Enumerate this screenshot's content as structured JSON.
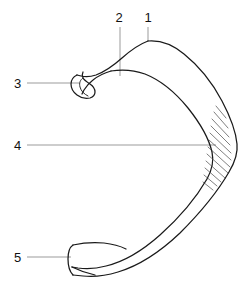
{
  "figure": {
    "background_color": "#ffffff",
    "outline_color": "#1a1a1a",
    "leader_color": "#8a8a8a",
    "label_color": "#111111",
    "width": 241,
    "height": 282
  },
  "labels": [
    {
      "id": "1",
      "text": "1",
      "x": 148,
      "y": 22,
      "anchor": "middle",
      "leader": {
        "type": "vertical",
        "x1": 148,
        "y1": 27,
        "x2": 148,
        "y2": 41
      }
    },
    {
      "id": "2",
      "text": "2",
      "x": 119,
      "y": 22,
      "anchor": "middle",
      "leader": {
        "type": "vertical",
        "x1": 120,
        "y1": 27,
        "x2": 120,
        "y2": 76
      }
    },
    {
      "id": "3",
      "text": "3",
      "x": 14,
      "y": 88,
      "anchor": "start",
      "leader": {
        "type": "horizontal",
        "x1": 27,
        "y1": 83,
        "x2": 79,
        "y2": 83
      }
    },
    {
      "id": "4",
      "text": "4",
      "x": 14,
      "y": 150,
      "anchor": "start",
      "leader": {
        "type": "horizontal",
        "x1": 27,
        "y1": 145,
        "x2": 216,
        "y2": 145
      }
    },
    {
      "id": "5",
      "text": "5",
      "x": 14,
      "y": 262,
      "anchor": "start",
      "leader": {
        "type": "horizontal",
        "x1": 27,
        "y1": 257,
        "x2": 71,
        "y2": 257
      }
    }
  ],
  "shapes": {
    "outer_contour": "M 148 41 C 160 40 172 44 184 54 C 199 66 212 82 222 101 C 231 118 236 133 237 144 C 238 153 235 162 229 172 C 218 191 200 213 180 233 C 160 252 138 266 118 272 C 105 276 92 277 83 276 L 73 275",
    "inner_contour": "M 111 71 C 123 69 134 70 145 74 C 160 80 175 92 188 108 C 200 123 209 139 212 152 C 214 161 212 170 207 179 C 196 198 179 218 160 235 C 142 251 123 262 106 266 C 95 269 85 269 78 268 L 72 267",
    "hook_upper": "M 148 41 C 140 44 131 50 122 58 C 113 66 104 72 96 75 C 90 77 85 77 81 76 L 77 75",
    "hook_lower": "M 111 71 C 104 73 98 76 93 80 C 89 83 86 87 84 90 L 82 94",
    "hook_tip": "M 77 75 C 73 77 71 80 71 84 C 71 88 73 92 77 95 C 81 98 86 99 90 98 C 93 97 95 95 95 92 C 95 89 93 86 90 84 C 87 82 84 80 83 78 C 82 76 82 74 83 72",
    "hook_tip_inner": "M 83 78 C 80 80 79 83 80 87 C 81 91 84 94 88 96",
    "end_cap_top": "M 73 275 C 70 272 68 266 68 259 C 68 252 70 247 73 245",
    "end_cap_band": "M 73 245 C 82 243 93 242 104 243 C 113 244 120 246 126 249",
    "end_cap_bottom": "M 72 267 C 78 270 86 273 95 275",
    "hatch_lines": [
      "M 214 112 L 228 128",
      "M 212 119 L 229 137",
      "M 211 126 L 230 145",
      "M 210 133 L 231 153",
      "M 209 140 L 231 160",
      "M 208 147 L 230 167",
      "M 207 154 L 228 173",
      "M 206 161 L 225 178",
      "M 205 168 L 221 182",
      "M 204 175 L 217 186",
      "M 203 182 L 213 190",
      "M 216 106 L 226 118"
    ]
  }
}
